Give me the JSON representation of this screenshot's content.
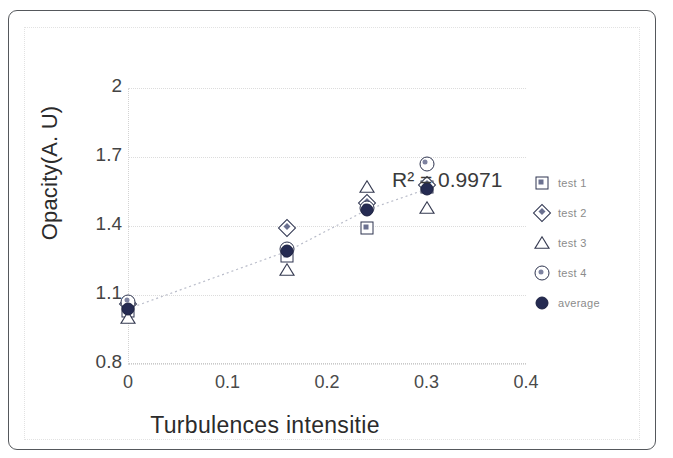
{
  "figure": {
    "frame_present": true,
    "background": "#ffffff",
    "border_color": "#55585c"
  },
  "annotation": {
    "r2_text": "R² = 0.9971"
  },
  "legend": {
    "position": "right",
    "items": [
      {
        "label": "test 1",
        "marker": "square",
        "icon": "square-marker-icon"
      },
      {
        "label": "test 2",
        "marker": "diamond",
        "icon": "diamond-marker-icon"
      },
      {
        "label": "test 3",
        "marker": "triangle",
        "icon": "triangle-marker-icon"
      },
      {
        "label": "test 4",
        "marker": "circle",
        "icon": "circle-marker-icon"
      },
      {
        "label": "average",
        "marker": "dot",
        "icon": "filled-dot-marker-icon"
      }
    ]
  },
  "chart_data": {
    "type": "scatter",
    "title": "",
    "xlabel": "Turbulences intensitie",
    "ylabel": "Opacity(A. U)",
    "xlim": [
      0,
      0.4
    ],
    "ylim": [
      0.8,
      2.0
    ],
    "xticks": [
      "0",
      "0.1",
      "0.2",
      "0.3",
      "0.4"
    ],
    "xtick_values": [
      0,
      0.1,
      0.2,
      0.3,
      0.4
    ],
    "yticks": [
      "0.8",
      "1.1",
      "1.4",
      "1.7",
      "2"
    ],
    "ytick_values": [
      0.8,
      1.1,
      1.4,
      1.7,
      2.0
    ],
    "grid": true,
    "grid_style": "dotted horizontal",
    "legend_position": "right",
    "annotations": [
      {
        "text": "R² = 0.9971",
        "x": 0.245,
        "y": 1.6
      }
    ],
    "trendline": {
      "present": true,
      "style": "dotted",
      "series": "average",
      "r_squared": 0.9971
    },
    "x": [
      0,
      0.16,
      0.24,
      0.3
    ],
    "series": [
      {
        "name": "test 1",
        "marker": "square",
        "values": [
          1.03,
          1.27,
          1.39,
          1.57
        ]
      },
      {
        "name": "test 2",
        "marker": "diamond",
        "values": [
          1.06,
          1.39,
          1.5,
          1.58
        ]
      },
      {
        "name": "test 3",
        "marker": "triangle",
        "values": [
          1.0,
          1.21,
          1.57,
          1.48
        ]
      },
      {
        "name": "test 4",
        "marker": "circle",
        "values": [
          1.07,
          1.3,
          1.48,
          1.67
        ]
      },
      {
        "name": "average",
        "marker": "dot",
        "values": [
          1.04,
          1.29,
          1.47,
          1.56
        ]
      }
    ]
  }
}
